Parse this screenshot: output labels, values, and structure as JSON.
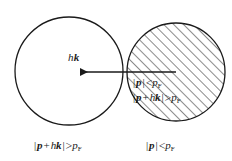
{
  "figure": {
    "background_color": "#ffffff",
    "stroke_color": "#1a1a1a"
  },
  "shapes": {
    "left_circle": {
      "name": "left-fermi-circle",
      "cx": 69,
      "cy": 71,
      "r": 54,
      "filled": false,
      "fill_label": "white"
    },
    "right_circle": {
      "name": "right-fermi-circle",
      "cx": 176,
      "cy": 72,
      "r": 49,
      "filled": true,
      "fill_label": "diagonal-hatching"
    },
    "hatch": {
      "angle_deg": 45,
      "spacing_px": 7,
      "line_width_px": 1,
      "color": "#1a1a1a"
    },
    "arrow": {
      "name": "momentum-transfer-arrow",
      "from_x": 176,
      "from_y": 72,
      "to_x": 77,
      "to_y": 72,
      "head_at": "left",
      "color": "#1a1a1a"
    }
  },
  "labels": {
    "arrow_vector": {
      "planck": "h",
      "wavevector": "k",
      "full_text": "hk"
    },
    "inner_line_1": {
      "bar_open": "|",
      "momentum": "p",
      "bar_close": "|",
      "relation": "<",
      "fermi_symbol": "p",
      "fermi_sub": "F",
      "full_text": "| p |<pF"
    },
    "inner_line_2": {
      "bar_open": "|",
      "momentum": "p",
      "plus": "+",
      "planck": "h",
      "wavevector": "k",
      "bar_close": "|",
      "relation": ">",
      "fermi_symbol": "p",
      "fermi_sub": "F",
      "full_text": "| p + hk |>pF"
    },
    "bottom_left": {
      "bar_open": "|",
      "momentum": "p",
      "plus": "+",
      "planck": "h",
      "wavevector": "k",
      "bar_close": "|",
      "relation": ">",
      "fermi_symbol": "p",
      "fermi_sub": "F",
      "full_text": "| p + hk |>pF"
    },
    "bottom_right": {
      "bar_open": "|",
      "momentum": "p",
      "bar_close": "|",
      "relation": "<",
      "fermi_symbol": "p",
      "fermi_sub": "F",
      "full_text": "| p |<pF"
    }
  }
}
